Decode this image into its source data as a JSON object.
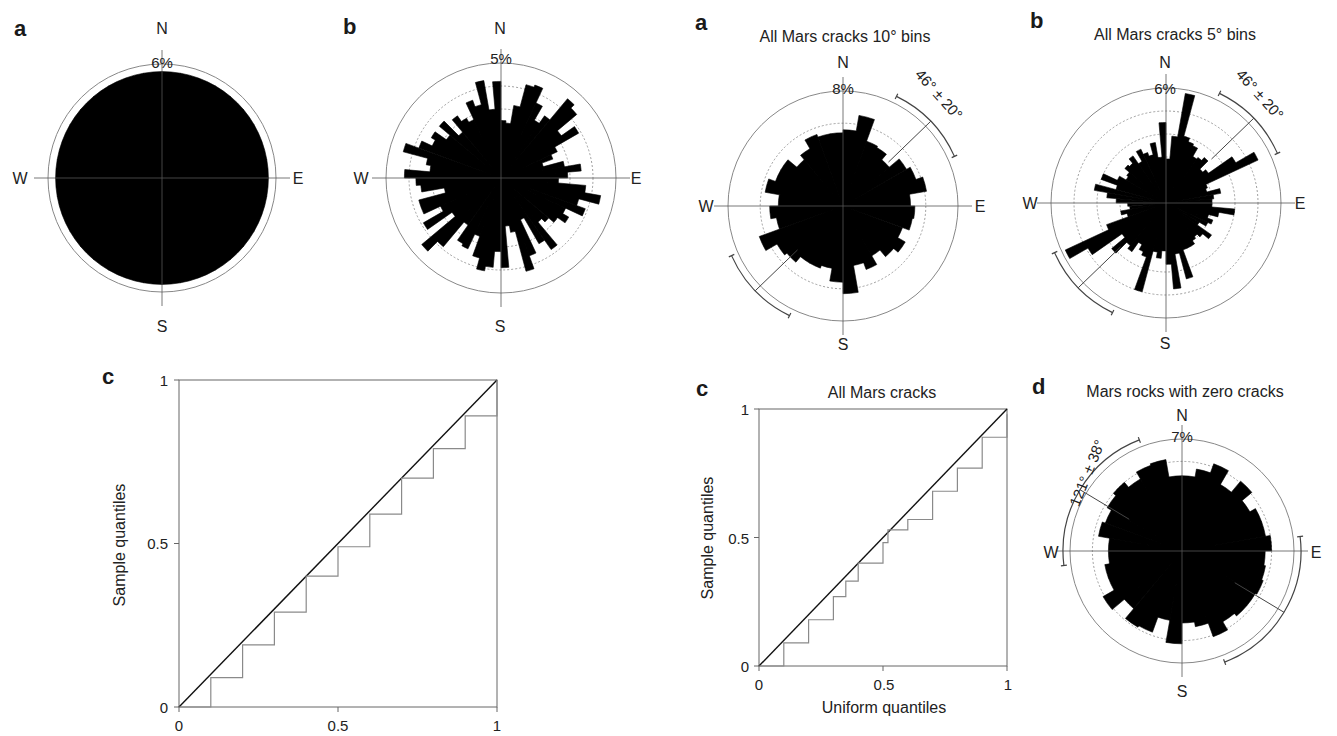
{
  "figure": {
    "left": {
      "panel_a": {
        "letter": "a",
        "scale_label": "6%",
        "N": "N",
        "S": "S",
        "E": "E",
        "W": "W"
      },
      "panel_b": {
        "letter": "b",
        "scale_label": "5%",
        "N": "N",
        "S": "S",
        "E": "E",
        "W": "W"
      },
      "panel_c": {
        "letter": "c",
        "ylabel": "Sample quantiles",
        "xticks": [
          "0",
          "0.5",
          "1"
        ],
        "yticks": [
          "0",
          "0.5",
          "1"
        ]
      }
    },
    "right": {
      "panel_a": {
        "letter": "a",
        "title": "All Mars cracks 10° bins",
        "scale_label": "8%",
        "mean_label": "46° ± 20°",
        "N": "N",
        "S": "S",
        "E": "E",
        "W": "W"
      },
      "panel_b": {
        "letter": "b",
        "title": "All Mars cracks 5° bins",
        "scale_label": "6%",
        "mean_label": "46° ± 20°",
        "N": "N",
        "S": "S",
        "E": "E",
        "W": "W"
      },
      "panel_c": {
        "letter": "c",
        "title": "All Mars cracks",
        "xlabel": "Uniform quantiles",
        "ylabel": "Sample quantiles",
        "xticks": [
          "0",
          "0.5",
          "1"
        ],
        "yticks": [
          "0",
          "0.5",
          "1"
        ]
      },
      "panel_d": {
        "letter": "d",
        "title": "Mars rocks with zero cracks",
        "scale_label": "7%",
        "mean_label": "121° ± 38°",
        "N": "N",
        "S": "S",
        "E": "E",
        "W": "W"
      }
    },
    "colors": {
      "bars": "#000000",
      "grid": "#888888",
      "qq_sample": "#8a8a8a",
      "qq_reference": "#111111"
    }
  },
  "chart_data": [
    {
      "type": "rose",
      "panel": "a (left)",
      "title": "",
      "bin_width_deg": 10,
      "max_scale": "6%",
      "description": "Near-uniform orientation distribution; all bins ~5.6%",
      "bin_centers_deg": [
        5,
        15,
        25,
        35,
        45,
        55,
        65,
        75,
        85,
        95,
        105,
        115,
        125,
        135,
        145,
        155,
        165,
        175,
        185,
        195,
        205,
        215,
        225,
        235,
        245,
        255,
        265,
        275,
        285,
        295,
        305,
        315,
        325,
        335,
        345,
        355
      ],
      "values_pct": [
        5.6,
        5.6,
        5.6,
        5.6,
        5.6,
        5.6,
        5.6,
        5.6,
        5.6,
        5.6,
        5.6,
        5.6,
        5.6,
        5.6,
        5.6,
        5.6,
        5.6,
        5.6,
        5.6,
        5.6,
        5.6,
        5.6,
        5.6,
        5.6,
        5.6,
        5.6,
        5.6,
        5.6,
        5.6,
        5.6,
        5.6,
        5.6,
        5.6,
        5.6,
        5.6,
        5.6
      ]
    },
    {
      "type": "rose",
      "panel": "b (left)",
      "bin_width_deg": 5,
      "max_scale": "5%",
      "bin_centers_deg": [
        2.5,
        7.5,
        12.5,
        17.5,
        22.5,
        27.5,
        32.5,
        37.5,
        42.5,
        47.5,
        52.5,
        57.5,
        62.5,
        67.5,
        72.5,
        77.5,
        82.5,
        87.5,
        92.5,
        97.5,
        102.5,
        107.5,
        112.5,
        117.5,
        122.5,
        127.5,
        132.5,
        137.5,
        142.5,
        147.5,
        152.5,
        157.5,
        162.5,
        167.5,
        172.5,
        177.5,
        182.5,
        187.5,
        192.5,
        197.5,
        202.5,
        207.5,
        212.5,
        217.5,
        222.5,
        227.5,
        232.5,
        237.5,
        242.5,
        247.5,
        252.5,
        257.5,
        262.5,
        267.5,
        272.5,
        277.5,
        282.5,
        287.5,
        292.5,
        297.5,
        302.5,
        307.5,
        312.5,
        317.5,
        322.5,
        327.5,
        332.5,
        337.5,
        342.5,
        347.5,
        352.5,
        357.5
      ],
      "values_pct": [
        2.5,
        2.4,
        3.2,
        4.2,
        4.3,
        3.6,
        2.9,
        3.3,
        4.5,
        4.3,
        3.2,
        3.9,
        2.7,
        2.4,
        1.9,
        2.8,
        3.5,
        2.9,
        2.5,
        3.7,
        4.4,
        3.5,
        3.9,
        3.1,
        3.4,
        3.0,
        2.7,
        2.5,
        3.8,
        3.3,
        2.0,
        3.6,
        4.2,
        2.4,
        2.1,
        3.9,
        3.2,
        3.9,
        4.1,
        3.6,
        2.7,
        3.4,
        3.3,
        2.5,
        3.9,
        4.5,
        2.6,
        3.9,
        2.9,
        3.7,
        3.7,
        2.5,
        3.5,
        3.7,
        4.2,
        3.1,
        3.3,
        4.4,
        3.8,
        3.3,
        3.5,
        2.9,
        3.5,
        2.6,
        3.3,
        3.0,
        2.8,
        3.6,
        3.3,
        4.3,
        3.0,
        4.2
      ]
    },
    {
      "type": "line",
      "panel": "c (left)",
      "xlabel": "",
      "ylabel": "Sample quantiles",
      "xlim": [
        0,
        1
      ],
      "ylim": [
        0,
        1
      ],
      "series": [
        {
          "name": "reference",
          "x": [
            0,
            1
          ],
          "y": [
            0,
            1
          ]
        },
        {
          "name": "sample",
          "x": [
            0,
            0.1,
            0.2,
            0.3,
            0.4,
            0.5,
            0.6,
            0.7,
            0.8,
            0.9,
            1.0
          ],
          "y": [
            0,
            0.09,
            0.19,
            0.29,
            0.4,
            0.49,
            0.59,
            0.7,
            0.79,
            0.89,
            1.0
          ]
        }
      ]
    },
    {
      "type": "rose",
      "panel": "a (right)",
      "title": "All Mars cracks 10° bins",
      "bin_width_deg": 10,
      "max_scale": "8%",
      "mean_direction": "46° ± 20°",
      "bin_centers_deg": [
        5,
        15,
        25,
        35,
        45,
        55,
        65,
        75,
        85,
        95,
        105,
        115,
        125,
        135,
        145,
        155,
        165,
        175,
        185,
        195,
        205,
        215,
        225,
        235,
        245,
        255,
        265,
        275,
        285,
        295,
        305,
        315,
        325,
        335,
        345,
        355
      ],
      "values_pct": [
        5.3,
        6.4,
        4.8,
        4.7,
        4.2,
        5.1,
        5.4,
        5.9,
        4.7,
        5.0,
        4.9,
        4.4,
        5.0,
        4.6,
        4.0,
        4.7,
        4.2,
        6.1,
        5.3,
        4.4,
        4.6,
        4.6,
        5.1,
        5.3,
        6.2,
        4.7,
        5.1,
        4.5,
        5.5,
        5.0,
        5.0,
        4.2,
        4.6,
        5.3,
        5.1,
        5.1
      ]
    },
    {
      "type": "rose",
      "panel": "b (right)",
      "title": "All Mars cracks 5° bins",
      "bin_width_deg": 5,
      "max_scale": "6%",
      "mean_direction": "46° ± 20°",
      "bin_centers_deg": [
        2.5,
        7.5,
        12.5,
        17.5,
        22.5,
        27.5,
        32.5,
        37.5,
        42.5,
        47.5,
        52.5,
        57.5,
        62.5,
        67.5,
        72.5,
        77.5,
        82.5,
        87.5,
        92.5,
        97.5,
        102.5,
        107.5,
        112.5,
        117.5,
        122.5,
        127.5,
        132.5,
        137.5,
        142.5,
        147.5,
        152.5,
        157.5,
        162.5,
        167.5,
        172.5,
        177.5,
        182.5,
        187.5,
        192.5,
        197.5,
        202.5,
        207.5,
        212.5,
        217.5,
        222.5,
        227.5,
        232.5,
        237.5,
        242.5,
        247.5,
        252.5,
        257.5,
        262.5,
        267.5,
        272.5,
        277.5,
        282.5,
        287.5,
        292.5,
        297.5,
        302.5,
        307.5,
        312.5,
        317.5,
        322.5,
        327.5,
        332.5,
        337.5,
        342.5,
        347.5,
        352.5,
        357.5
      ],
      "values_pct": [
        2.3,
        3.5,
        5.8,
        3.6,
        3.4,
        3.3,
        2.8,
        2.9,
        3.1,
        2.5,
        2.7,
        4.2,
        5.3,
        2.3,
        2.2,
        2.9,
        2.5,
        2.4,
        2.4,
        3.6,
        2.8,
        2.3,
        2.6,
        2.4,
        2.0,
        2.9,
        2.5,
        2.3,
        2.4,
        2.6,
        2.6,
        2.6,
        4.1,
        2.7,
        4.5,
        3.2,
        2.5,
        2.9,
        2.6,
        4.8,
        3.0,
        2.8,
        2.5,
        3.1,
        2.9,
        3.7,
        2.8,
        4.7,
        5.8,
        3.3,
        2.1,
        2.4,
        1.9,
        2.0,
        2.6,
        3.1,
        3.8,
        2.7,
        3.6,
        2.8,
        2.4,
        2.5,
        2.8,
        2.7,
        3.0,
        2.5,
        3.1,
        2.8,
        2.6,
        3.2,
        2.4,
        4.2
      ]
    },
    {
      "type": "line",
      "panel": "c (right)",
      "title": "All Mars cracks",
      "xlabel": "Uniform quantiles",
      "ylabel": "Sample quantiles",
      "xlim": [
        0,
        1
      ],
      "ylim": [
        0,
        1
      ],
      "series": [
        {
          "name": "reference",
          "x": [
            0,
            1
          ],
          "y": [
            0,
            1
          ]
        },
        {
          "name": "sample",
          "x": [
            0,
            0.1,
            0.2,
            0.3,
            0.35,
            0.4,
            0.45,
            0.5,
            0.52,
            0.6,
            0.7,
            0.8,
            0.9,
            1.0
          ],
          "y": [
            0,
            0.09,
            0.18,
            0.27,
            0.33,
            0.4,
            0.4,
            0.48,
            0.53,
            0.57,
            0.68,
            0.77,
            0.89,
            0.98
          ]
        }
      ]
    },
    {
      "type": "rose",
      "panel": "d (right)",
      "title": "Mars rocks with zero cracks",
      "bin_width_deg": 10,
      "max_scale": "7%",
      "mean_direction": "121° ± 38°",
      "bin_centers_deg": [
        5,
        15,
        25,
        35,
        45,
        55,
        65,
        75,
        85,
        95,
        105,
        115,
        125,
        135,
        145,
        155,
        165,
        175,
        185,
        195,
        205,
        215,
        225,
        235,
        245,
        255,
        265,
        275,
        285,
        295,
        305,
        315,
        325,
        335,
        345,
        355
      ],
      "values_pct": [
        4.7,
        5.2,
        5.8,
        4.8,
        5.7,
        4.9,
        5.3,
        5.3,
        5.6,
        5.2,
        5.3,
        5.4,
        5.3,
        5.3,
        5.1,
        5.7,
        4.8,
        4.5,
        5.8,
        4.4,
        5.4,
        5.5,
        4.7,
        5.7,
        4.9,
        4.9,
        4.6,
        4.6,
        5.3,
        5.1,
        5.4,
        5.6,
        5.2,
        5.7,
        5.8,
        4.7
      ]
    }
  ]
}
